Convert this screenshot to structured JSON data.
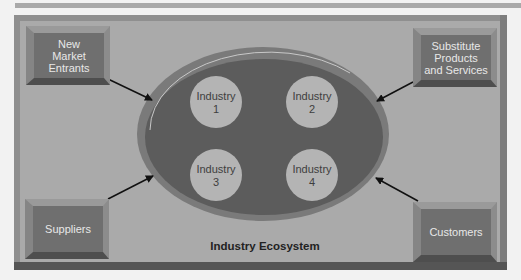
{
  "diagram": {
    "title": "Industry Ecosystem",
    "forces": [
      {
        "id": "new-market-entrants",
        "label": "New\nMarket\nEntrants"
      },
      {
        "id": "substitute-products",
        "label": "Substitute\nProducts\nand Services"
      },
      {
        "id": "suppliers",
        "label": "Suppliers"
      },
      {
        "id": "customers",
        "label": "Customers"
      }
    ],
    "industries": [
      {
        "label1": "Industry",
        "label2": "1"
      },
      {
        "label1": "Industry",
        "label2": "2"
      },
      {
        "label1": "Industry",
        "label2": "3"
      },
      {
        "label1": "Industry",
        "label2": "4"
      }
    ],
    "colors": {
      "panel": "#aaaaaa",
      "box_face": "#6f6f6f",
      "ellipse_ring": "#7a7a7a",
      "ellipse_inner": "#5c5c5c",
      "circle_fill": "#b4b4b4",
      "arrow": "#111111"
    }
  }
}
